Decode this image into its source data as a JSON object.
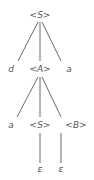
{
  "diagram": {
    "type": "parse-tree",
    "colors": {
      "text": "#555555",
      "edge": "#444444",
      "background": "#ffffff"
    },
    "nodes": [
      {
        "id": "n0",
        "label": "<S>",
        "x": 40,
        "y": 18
      },
      {
        "id": "n1",
        "label": "d",
        "x": 11,
        "y": 72
      },
      {
        "id": "n2",
        "label": "<A>",
        "x": 40,
        "y": 72
      },
      {
        "id": "n3",
        "label": "a",
        "x": 69,
        "y": 72
      },
      {
        "id": "n4",
        "label": "a",
        "x": 11,
        "y": 128
      },
      {
        "id": "n5",
        "label": "<S>",
        "x": 40,
        "y": 128
      },
      {
        "id": "n6",
        "label": "<B>",
        "x": 76,
        "y": 128
      },
      {
        "id": "n7",
        "label": "ε",
        "x": 40,
        "y": 172
      },
      {
        "id": "n8",
        "label": "ε",
        "x": 61,
        "y": 172
      }
    ],
    "edges": [
      {
        "from": "n0",
        "to": "n1",
        "x1": 38,
        "y1": 22,
        "x2": 18,
        "y2": 61
      },
      {
        "from": "n0",
        "to": "n2",
        "x1": 40,
        "y1": 22,
        "x2": 40,
        "y2": 61
      },
      {
        "from": "n0",
        "to": "n3",
        "x1": 42,
        "y1": 22,
        "x2": 61,
        "y2": 61
      },
      {
        "from": "n2",
        "to": "n4",
        "x1": 38,
        "y1": 77,
        "x2": 17,
        "y2": 117
      },
      {
        "from": "n2",
        "to": "n5",
        "x1": 40,
        "y1": 77,
        "x2": 40,
        "y2": 117
      },
      {
        "from": "n2",
        "to": "n6",
        "x1": 42,
        "y1": 77,
        "x2": 61,
        "y2": 117
      },
      {
        "from": "n5",
        "to": "n7",
        "x1": 40,
        "y1": 133,
        "x2": 40,
        "y2": 163
      },
      {
        "from": "n6",
        "to": "n8",
        "x1": 61,
        "y1": 133,
        "x2": 61,
        "y2": 163
      }
    ]
  }
}
